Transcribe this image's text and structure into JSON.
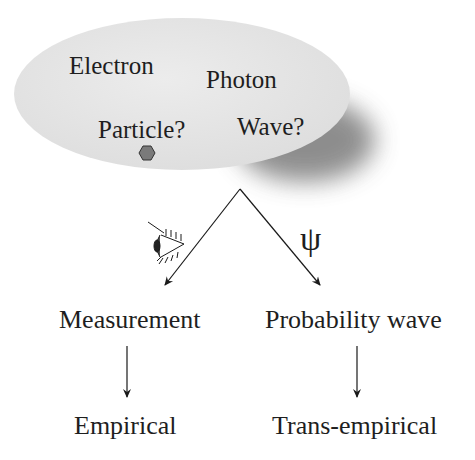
{
  "cloud": {
    "labels": [
      "Electron",
      "Photon",
      "Particle?",
      "Wave?"
    ],
    "fill": "#e6e6e6",
    "shadow": "#8c8c8c"
  },
  "branches": {
    "left_icon": "eye-icon",
    "right_symbol": "ψ",
    "left": {
      "top": "Measurement",
      "bottom": "Empirical"
    },
    "right": {
      "top": "Probability wave",
      "bottom": "Trans-empirical"
    }
  }
}
